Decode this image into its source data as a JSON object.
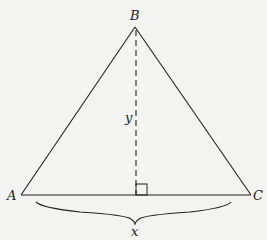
{
  "diagram": {
    "type": "triangle-with-altitude",
    "vertices": {
      "A": {
        "label": "A",
        "x": 21,
        "y": 195
      },
      "B": {
        "label": "B",
        "x": 135,
        "y": 27
      },
      "C": {
        "label": "C",
        "x": 251,
        "y": 195
      }
    },
    "altitude": {
      "label": "y",
      "style": "dashed",
      "from": "B",
      "foot_x": 136
    },
    "base": {
      "label": "x",
      "brace": true
    },
    "right_angle_marker": true,
    "colors": {
      "stroke": "#222222",
      "background": "#f3f3f1"
    }
  }
}
